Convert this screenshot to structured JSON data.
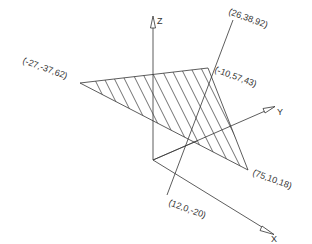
{
  "diagram": {
    "type": "3d-plane-line-intersection",
    "axes": {
      "x_label": "X",
      "y_label": "Y",
      "z_label": "Z"
    },
    "plane_points": [
      {
        "label": "(-27,-37,62)",
        "coords": [
          -27,
          -37,
          62
        ]
      },
      {
        "label": "(-10,57,43)",
        "coords": [
          -10,
          57,
          43
        ]
      },
      {
        "label": "(75,10,18)",
        "coords": [
          75,
          10,
          18
        ]
      }
    ],
    "line_points": [
      {
        "label": "(26,38,92)",
        "coords": [
          26,
          38,
          92
        ]
      },
      {
        "label": "(12,0,-20)",
        "coords": [
          12,
          0,
          -20
        ]
      }
    ],
    "colors": {
      "line": "#333333",
      "hatch": "#333333",
      "background": "#ffffff"
    }
  }
}
